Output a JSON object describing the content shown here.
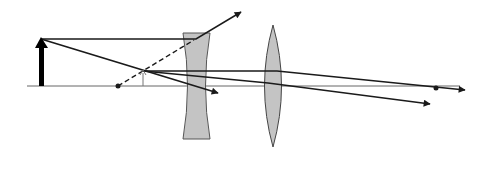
{
  "diagram": {
    "colors": {
      "background": "#ffffff",
      "ray": "#1a1a1a",
      "axis": "#555555",
      "lens_fill": "#c4c4c4",
      "lens_stroke": "#444444",
      "object": "#000000"
    },
    "elements": {
      "optical_axis": {
        "x1": 27,
        "y1": 86,
        "x2": 460,
        "y2": 86
      },
      "object_arrow": {
        "x": 41,
        "base_y": 86,
        "tip_y": 38
      },
      "virtual_image_arrow": {
        "x": 143,
        "base_y": 86,
        "tip_y": 71
      },
      "focal_point_left": {
        "x": 118,
        "y": 86
      },
      "focal_point_right": {
        "x": 436,
        "y": 88
      },
      "diverging_lens": {
        "cx": 196,
        "top": 33,
        "bottom": 139,
        "half_width_edge": 13,
        "half_width_center": 8
      },
      "converging_lens": {
        "cx": 273,
        "top": 25,
        "bottom": 147,
        "half_width": 10
      }
    },
    "rays": [
      {
        "name": "parallel-ray",
        "points": [
          [
            41,
            39
          ],
          [
            196,
            39
          ],
          [
            243,
            11
          ]
        ],
        "arrow": true,
        "dashed": false
      },
      {
        "name": "virtual-extension",
        "points": [
          [
            118,
            86
          ],
          [
            196,
            39
          ]
        ],
        "arrow": false,
        "dashed": true
      },
      {
        "name": "chief-ray",
        "points": [
          [
            41,
            39
          ],
          [
            218,
            93
          ]
        ],
        "arrow": true,
        "dashed": false
      },
      {
        "name": "image-parallel-ray",
        "points": [
          [
            143,
            71
          ],
          [
            277,
            71
          ],
          [
            465,
            90
          ]
        ],
        "arrow": true,
        "dashed": false
      },
      {
        "name": "image-oblique-ray",
        "points": [
          [
            143,
            71
          ],
          [
            268,
            83
          ],
          [
            430,
            104
          ]
        ],
        "arrow": true,
        "dashed": false
      }
    ]
  }
}
